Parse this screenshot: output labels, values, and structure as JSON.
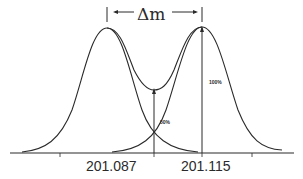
{
  "diagram": {
    "title_annotation": "Δm",
    "peaks": [
      {
        "label": "201.087",
        "center_x": 107,
        "height_pct": 100
      },
      {
        "label": "201.115",
        "center_x": 202,
        "height_pct": 100
      }
    ],
    "annotations": {
      "peak_height": "100%",
      "valley_height": "50%"
    },
    "axis": {
      "tick_labels": [
        "201.087",
        "201.115"
      ],
      "tick_positions_px": [
        60,
        154,
        202,
        252
      ]
    },
    "colors": {
      "line": "#2a2a2a",
      "background": "#ffffff"
    }
  }
}
